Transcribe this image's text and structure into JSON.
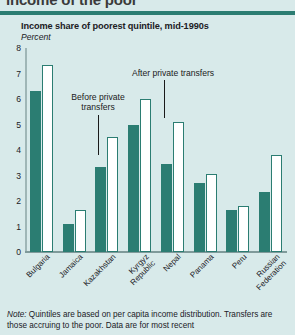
{
  "clipped_heading": "income of the poor",
  "chart_data": {
    "type": "bar",
    "title": "Income share of poorest quintile, mid-1990s",
    "subtitle": "Percent",
    "xlabel": "",
    "ylabel": "Percent",
    "ylim": [
      0,
      8
    ],
    "yticks": [
      "8",
      "7",
      "6",
      "5",
      "4",
      "3",
      "2",
      "1",
      "0"
    ],
    "grid": false,
    "legend_position": "annotations",
    "categories": [
      "Bulgaria",
      "Jamaica",
      "Kazakhstan",
      "Kyrgyz\nRepublic",
      "Nepal",
      "Panama",
      "Peru",
      "Russian\nFederation"
    ],
    "series": [
      {
        "name": "Before private transfers",
        "color": "#2b7d72",
        "values": [
          6.3,
          1.1,
          3.35,
          5.0,
          3.45,
          2.7,
          1.65,
          2.35
        ]
      },
      {
        "name": "After private transfers",
        "color": "#ffffff",
        "values": [
          7.35,
          1.65,
          4.5,
          6.0,
          5.1,
          3.05,
          1.8,
          3.8
        ]
      }
    ],
    "annotations": [
      {
        "text": "Before private\ntransfers",
        "target": "Kazakhstan before-transfers bar"
      },
      {
        "text": "After private transfers",
        "target": "Kyrgyz Republic after-transfers bar"
      }
    ]
  },
  "note": {
    "label": "Note:",
    "text": " Quintiles are based on per capita income distribution. Transfers are those accruing to the poor. Data are for most recent"
  },
  "colors": {
    "background": "#d8eaea",
    "teal": "#2b7d72",
    "white_bar": "#ffffff",
    "axis": "#9fb6b6"
  }
}
